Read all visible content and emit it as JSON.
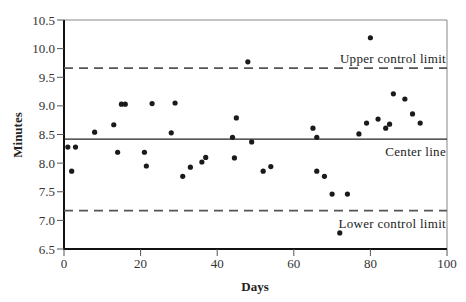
{
  "chart_data": {
    "type": "scatter",
    "title": "",
    "xlabel": "Days",
    "ylabel": "Minutes",
    "xlim": [
      0,
      100
    ],
    "ylim": [
      6.5,
      10.5
    ],
    "x_ticks": [
      0,
      20,
      40,
      60,
      80,
      100
    ],
    "x_tick_labels": [
      "0",
      "20",
      "40",
      "60",
      "80",
      "100"
    ],
    "y_ticks": [
      6.5,
      7.0,
      7.5,
      8.0,
      8.5,
      9.0,
      9.5,
      10.0,
      10.5
    ],
    "y_tick_labels": [
      "6.5",
      "7.0",
      "7.5",
      "8.0",
      "8.5",
      "9.0",
      "9.5",
      "10.0",
      "10.5"
    ],
    "grid": false,
    "legend": null,
    "reference_lines": [
      {
        "name": "Upper control limit",
        "y": 9.66,
        "style": "dashed"
      },
      {
        "name": "Center line",
        "y": 8.42,
        "style": "solid"
      },
      {
        "name": "Lower control limit",
        "y": 7.17,
        "style": "dashed"
      }
    ],
    "annotations": [
      "Upper control limit",
      "Center line",
      "Lower control limit"
    ],
    "series": [
      {
        "name": "Observations",
        "points": [
          [
            1,
            8.28
          ],
          [
            2,
            7.86
          ],
          [
            3,
            8.28
          ],
          [
            8,
            8.54
          ],
          [
            13,
            8.67
          ],
          [
            14,
            8.19
          ],
          [
            15,
            9.03
          ],
          [
            16,
            9.03
          ],
          [
            21,
            8.19
          ],
          [
            21.5,
            7.95
          ],
          [
            23,
            9.04
          ],
          [
            28,
            8.53
          ],
          [
            29,
            9.05
          ],
          [
            31,
            7.77
          ],
          [
            33,
            7.93
          ],
          [
            36,
            8.02
          ],
          [
            37,
            8.1
          ],
          [
            44,
            8.45
          ],
          [
            45,
            8.79
          ],
          [
            44.5,
            8.09
          ],
          [
            48,
            9.77
          ],
          [
            49,
            8.37
          ],
          [
            52,
            7.86
          ],
          [
            54,
            7.94
          ],
          [
            65,
            8.61
          ],
          [
            66,
            8.45
          ],
          [
            66,
            7.86
          ],
          [
            68,
            7.77
          ],
          [
            70,
            7.46
          ],
          [
            74,
            7.46
          ],
          [
            72,
            6.78
          ],
          [
            77,
            8.51
          ],
          [
            79,
            8.7
          ],
          [
            80,
            10.19
          ],
          [
            82,
            8.77
          ],
          [
            84,
            8.61
          ],
          [
            85,
            8.68
          ],
          [
            86,
            9.21
          ],
          [
            89,
            9.12
          ],
          [
            91,
            8.86
          ],
          [
            93,
            8.7
          ]
        ]
      }
    ]
  },
  "labels": {
    "x_axis_title": "Days",
    "y_axis_title": "Minutes",
    "ucl": "Upper control limit",
    "center": "Center line",
    "lcl": "Lower control limit"
  }
}
